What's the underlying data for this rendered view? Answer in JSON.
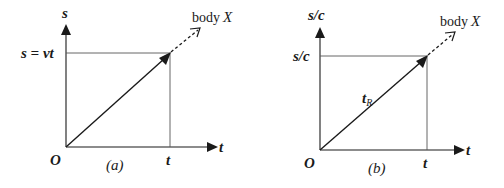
{
  "figure": {
    "panels": [
      {
        "id": "a",
        "caption": "(a)",
        "y_axis_label": "s",
        "x_axis_label": "t",
        "origin_label": "O",
        "y_marker_label": "s = vt",
        "x_marker_label": "t",
        "line_label": "",
        "object_label_prefix": "body",
        "object_label_name": "X"
      },
      {
        "id": "b",
        "caption": "(b)",
        "y_axis_label": "s/c",
        "x_axis_label": "t",
        "origin_label": "O",
        "y_marker_label": "s/c",
        "x_marker_label": "t",
        "line_label_main": "t",
        "line_label_sub": "R",
        "object_label_prefix": "body",
        "object_label_name": "X"
      }
    ],
    "colors": {
      "ink": "#1a1a1a",
      "guide": "#555555",
      "background": "#ffffff"
    }
  }
}
